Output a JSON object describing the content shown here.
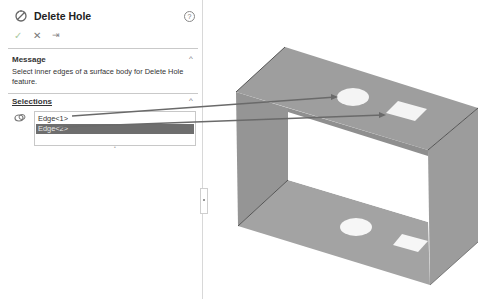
{
  "property_manager": {
    "title": "Delete Hole",
    "help_label": "?",
    "actions": {
      "ok_icon": "✓",
      "cancel_icon": "✕",
      "pin_icon": "⇥"
    },
    "message_section": {
      "header": "Message",
      "text": "Select inner edges of a surface body for Delete Hole feature."
    },
    "selections_section": {
      "header": "Selections",
      "items": [
        {
          "label": "Edge<1>",
          "selected": false
        },
        {
          "label": "Edge<2>",
          "selected": true
        }
      ]
    },
    "collapse_icon": "^"
  },
  "graphics_area": {
    "model": "open rectangular sheet-metal box (surface body) with circular and square holes on top and bottom faces",
    "callouts": [
      {
        "from": "Edge<1>",
        "to": "circular hole on top face"
      },
      {
        "from": "Edge<2>",
        "to": "square hole on top face"
      }
    ],
    "colors": {
      "face": "#9a9a9a",
      "face_dark": "#8e8e8e",
      "edge": "#555555",
      "hole": "#f2f2f2",
      "leader": "#6a6a6a"
    }
  }
}
